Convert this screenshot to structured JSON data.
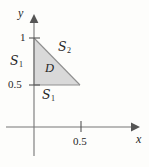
{
  "figure": {
    "type": "math-diagram",
    "background_color": "#fdfdfb",
    "axes": {
      "x_axis_label": "x",
      "y_axis_label": "y",
      "x_ticks": [
        {
          "value": "0.5",
          "label": "0.5"
        }
      ],
      "y_ticks": [
        {
          "value": "1",
          "label": "1"
        },
        {
          "value": "0.5",
          "label": "0.5"
        }
      ],
      "axis_color": "#6e6e6e"
    },
    "region": {
      "label": "D",
      "fill_color": "#d9d9d9",
      "edge_color": "#8a8a8a",
      "vertices": [
        {
          "x": 0,
          "y": 1
        },
        {
          "x": 0,
          "y": 0.5
        },
        {
          "x": 0.25,
          "y": 0.5
        }
      ]
    },
    "boundary_labels": [
      {
        "name": "left-edge",
        "symbol": "S",
        "subscript": "1"
      },
      {
        "name": "hypotenuse",
        "symbol": "S",
        "subscript": "2"
      },
      {
        "name": "bottom-edge",
        "symbol": "S",
        "subscript": "1"
      }
    ]
  }
}
